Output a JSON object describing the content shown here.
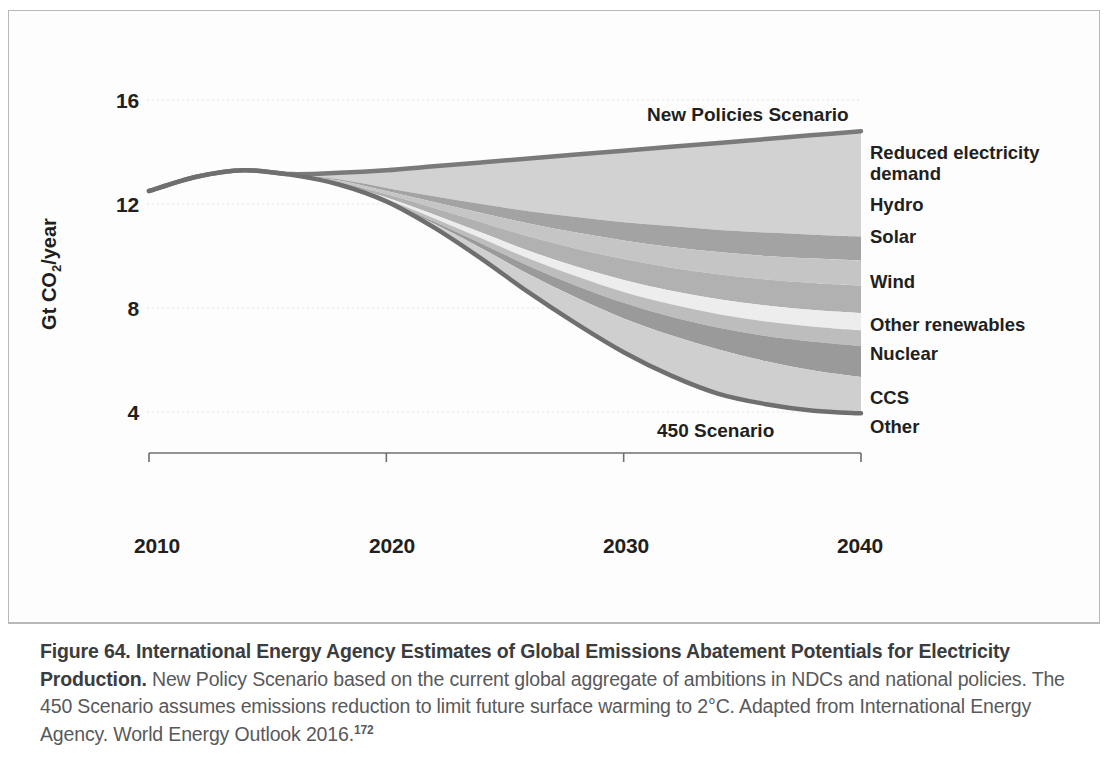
{
  "figure": {
    "caption_bold": "Figure 64. International Energy Agency Estimates of Global Emissions Abatement Potentials for Electricity Production.",
    "caption_rest": " New Policy Scenario based on the current global aggregate of ambitions in NDCs and national policies. The 450 Scenario assumes emissions reduction to limit future surface warming to 2°C. Adapted from International Energy Agency. World Energy Outlook 2016.",
    "caption_ref": "172"
  },
  "axes": {
    "y_label_prefix": "Gt CO",
    "y_label_sub": "2",
    "y_label_suffix": "/year",
    "y_ticks": [
      "16",
      "12",
      "8",
      "4"
    ],
    "x_ticks": [
      "2010",
      "2020",
      "2030",
      "2040"
    ]
  },
  "annotations": {
    "new_policies": "New Policies Scenario",
    "scenario_450": "450 Scenario"
  },
  "chart_data": {
    "type": "area",
    "title": "International Energy Agency Estimates of Global Emissions Abatement Potentials for Electricity Production",
    "xlabel": "",
    "ylabel": "Gt CO2/year",
    "xlim": [
      2010,
      2040
    ],
    "ylim": [
      2.2,
      17.0
    ],
    "yticks": [
      4,
      8,
      12,
      16
    ],
    "xticks": [
      2010,
      2020,
      2030,
      2040
    ],
    "grid": "horizontal-faint",
    "legend_position": "right-outside",
    "x": [
      2010,
      2012,
      2014,
      2016,
      2018,
      2020,
      2022,
      2024,
      2026,
      2028,
      2030,
      2032,
      2034,
      2036,
      2038,
      2040
    ],
    "series": [
      {
        "name": "New Policies Scenario",
        "kind": "line",
        "color": "#7a7a7a",
        "values": [
          12.5,
          13.05,
          13.3,
          13.15,
          13.2,
          13.3,
          13.45,
          13.6,
          13.75,
          13.9,
          14.05,
          14.2,
          14.35,
          14.5,
          14.65,
          14.8
        ]
      },
      {
        "name": "450 Scenario",
        "kind": "line",
        "color": "#6f6f6f",
        "values": [
          12.5,
          13.05,
          13.3,
          13.12,
          12.75,
          12.1,
          11.1,
          9.9,
          8.6,
          7.4,
          6.3,
          5.4,
          4.7,
          4.3,
          4.05,
          3.95
        ]
      }
    ],
    "bands": [
      {
        "name": "Reduced electricity demand",
        "color": "#d2d2d2",
        "top_series": "New Policies Scenario",
        "lower_boundary": [
          12.5,
          13.05,
          13.3,
          13.13,
          12.95,
          12.62,
          12.3,
          12.0,
          11.72,
          11.5,
          11.3,
          11.15,
          11.0,
          10.9,
          10.82,
          10.75
        ]
      },
      {
        "name": "Hydro",
        "color": "#a3a3a3",
        "lower_boundary": [
          12.5,
          13.05,
          13.3,
          13.12,
          12.9,
          12.5,
          12.08,
          11.65,
          11.25,
          10.9,
          10.6,
          10.35,
          10.15,
          10.0,
          9.9,
          9.82
        ]
      },
      {
        "name": "Solar",
        "color": "#c5c5c5",
        "lower_boundary": [
          12.5,
          13.05,
          13.3,
          13.12,
          12.85,
          12.38,
          11.85,
          11.3,
          10.75,
          10.28,
          9.88,
          9.55,
          9.3,
          9.1,
          8.96,
          8.86
        ]
      },
      {
        "name": "Wind",
        "color": "#b1b1b1",
        "lower_boundary": [
          12.5,
          13.05,
          13.3,
          13.12,
          12.8,
          12.25,
          11.6,
          10.9,
          10.2,
          9.6,
          9.08,
          8.66,
          8.34,
          8.1,
          7.92,
          7.8
        ]
      },
      {
        "name": "Other renewables",
        "color": "#ededed",
        "lower_boundary": [
          12.5,
          13.05,
          13.3,
          13.12,
          12.78,
          12.18,
          11.45,
          10.68,
          9.9,
          9.22,
          8.62,
          8.14,
          7.76,
          7.48,
          7.28,
          7.14
        ]
      },
      {
        "name": "Nuclear",
        "color": "#bdbdbd",
        "lower_boundary": [
          12.5,
          13.05,
          13.3,
          13.12,
          12.76,
          12.12,
          11.33,
          10.48,
          9.62,
          8.86,
          8.2,
          7.66,
          7.24,
          6.92,
          6.7,
          6.54
        ]
      },
      {
        "name": "CCS",
        "color": "#9a9a9a",
        "lower_boundary": [
          12.5,
          13.05,
          13.3,
          13.12,
          12.75,
          12.1,
          11.25,
          10.3,
          9.3,
          8.4,
          7.6,
          6.95,
          6.4,
          5.95,
          5.6,
          5.35
        ]
      },
      {
        "name": "Other",
        "color": "#cfcfcf",
        "lower_boundary": [
          12.5,
          13.05,
          13.3,
          13.12,
          12.75,
          12.1,
          11.1,
          9.9,
          8.6,
          7.4,
          6.3,
          5.4,
          4.7,
          4.3,
          4.05,
          3.95
        ]
      }
    ],
    "legend_entries": [
      {
        "label": "Reduced electricity\ndemand",
        "color": "#d2d2d2"
      },
      {
        "label": "Hydro",
        "color": "#a3a3a3"
      },
      {
        "label": "Solar",
        "color": "#c5c5c5"
      },
      {
        "label": "Wind",
        "color": "#b1b1b1"
      },
      {
        "label": "Other renewables",
        "color": "#ededed"
      },
      {
        "label": "Nuclear",
        "color": "#bdbdbd"
      },
      {
        "label": "CCS",
        "color": "#9a9a9a"
      },
      {
        "label": "Other",
        "color": "#cfcfcf"
      }
    ]
  }
}
